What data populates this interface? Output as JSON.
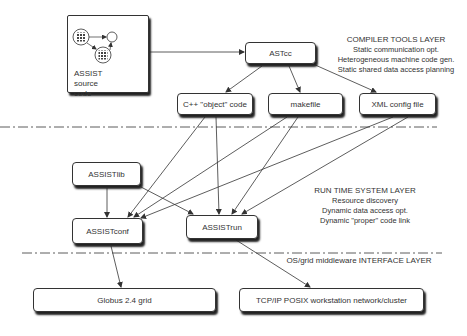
{
  "diagram": {
    "source_box": {
      "label_lines": [
        "ASSIST",
        "source",
        "code"
      ]
    },
    "nodes": {
      "astcc": "ASTcc",
      "cpp_object": "C++ \"object\" code",
      "makefile": "makefile",
      "xml_config": "XML config file",
      "assistlib": "ASSISTlib",
      "assistconf": "ASSISTconf",
      "assistrun": "ASSISTrun",
      "globus": "Globus 2.4 grid",
      "tcpip": "TCP/IP POSIX workstation network/cluster"
    },
    "layers": {
      "compiler": {
        "title": "COMPILER TOOLS LAYER",
        "items": [
          "Static communication opt.",
          "Heterogeneous machine code gen.",
          "Static shared data access planning"
        ]
      },
      "runtime": {
        "title": "RUN TIME SYSTEM LAYER",
        "items": [
          "Resource discovery",
          "Dynamic data access opt.",
          "Dynamic \"proper\" code link"
        ]
      },
      "interface": {
        "title": "OS/grid middleware INTERFACE LAYER"
      }
    },
    "edges": [
      [
        "source_box",
        "astcc"
      ],
      [
        "astcc",
        "cpp_object"
      ],
      [
        "astcc",
        "makefile"
      ],
      [
        "astcc",
        "xml_config"
      ],
      [
        "cpp_object",
        "assistconf"
      ],
      [
        "cpp_object",
        "assistrun"
      ],
      [
        "makefile",
        "assistconf"
      ],
      [
        "makefile",
        "assistrun"
      ],
      [
        "xml_config",
        "assistconf"
      ],
      [
        "xml_config",
        "assistrun"
      ],
      [
        "assistlib",
        "assistconf"
      ],
      [
        "assistlib",
        "assistrun"
      ],
      [
        "assistconf",
        "globus"
      ],
      [
        "assistrun",
        "tcpip"
      ]
    ],
    "colors": {
      "line": "#333333",
      "shadow": "#222222",
      "background": "#ffffff"
    }
  }
}
